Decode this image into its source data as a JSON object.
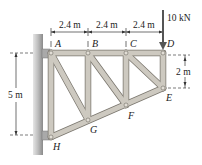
{
  "diagram": {
    "type": "truss",
    "colors": {
      "member_fill": "#c9c5bc",
      "member_edge": "#7a766e",
      "wall_fill": "#b9b9b9",
      "wall_shade": "#8e8e8e",
      "pin": "#9a968e",
      "text": "#222222"
    },
    "joints": {
      "A": "A",
      "B": "B",
      "C": "C",
      "D": "D",
      "E": "E",
      "F": "F",
      "G": "G",
      "H": "H"
    },
    "dimensions": {
      "span_AB": "2.4 m",
      "span_BC": "2.4 m",
      "span_CD": "2.4 m",
      "height_AH": "5 m",
      "height_DE": "2 m"
    },
    "load": {
      "label": "10 kN",
      "at_joint": "D",
      "direction": "down"
    }
  }
}
